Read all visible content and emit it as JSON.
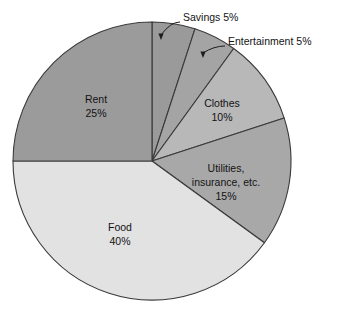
{
  "chart_data": {
    "type": "pie",
    "title": "",
    "subtitle": "",
    "xlabel": "",
    "ylabel": "",
    "legend_position": "none",
    "grid": false,
    "units": "percent",
    "total": 100,
    "start_angle_deg": 0,
    "direction": "clockwise",
    "categories": [
      "Savings",
      "Entertainment",
      "Clothes",
      "Utilities, insurance, etc.",
      "Food",
      "Rent"
    ],
    "values": [
      5,
      5,
      10,
      15,
      40,
      25
    ],
    "slices": [
      {
        "name": "Savings",
        "value": 5,
        "value_label": "5%",
        "label_mode": "callout",
        "label_line1": "Savings 5%",
        "label_line2": "",
        "color": "#9a9a9a",
        "start_deg": 0,
        "end_deg": 18
      },
      {
        "name": "Entertainment",
        "value": 5,
        "value_label": "5%",
        "label_mode": "callout",
        "label_line1": "Entertainment 5%",
        "label_line2": "",
        "color": "#a4a4a4",
        "start_deg": 18,
        "end_deg": 36
      },
      {
        "name": "Clothes",
        "value": 10,
        "value_label": "10%",
        "label_mode": "inside",
        "label_line1": "Clothes",
        "label_line2": "10%",
        "color": "#b8b8b8",
        "start_deg": 36,
        "end_deg": 72
      },
      {
        "name": "Utilities, insurance, etc.",
        "value": 15,
        "value_label": "15%",
        "label_mode": "inside",
        "label_line1": "Utilities,",
        "label_line2": "insurance, etc.",
        "label_line3": "15%",
        "color": "#a8a8a8",
        "start_deg": 72,
        "end_deg": 126
      },
      {
        "name": "Food",
        "value": 40,
        "value_label": "40%",
        "label_mode": "inside",
        "label_line1": "Food",
        "label_line2": "40%",
        "color": "#e2e2e2",
        "start_deg": 126,
        "end_deg": 270
      },
      {
        "name": "Rent",
        "value": 25,
        "value_label": "25%",
        "label_mode": "inside",
        "label_line1": "Rent",
        "label_line2": "25%",
        "color": "#9b9b9b",
        "start_deg": 270,
        "end_deg": 360
      }
    ],
    "geometry": {
      "center_x": 152,
      "center_y": 161,
      "radius": 139
    },
    "callouts": [
      {
        "name": "Savings",
        "text": "Savings 5%",
        "text_x": 183,
        "text_y": 18,
        "leader_from_x": 180,
        "leader_from_y": 22,
        "leader_to_x": 161,
        "leader_to_y": 40
      },
      {
        "name": "Entertainment",
        "text": "Entertainment 5%",
        "text_x": 228,
        "text_y": 42,
        "leader_from_x": 225,
        "leader_from_y": 46,
        "leader_to_x": 203,
        "leader_to_y": 58
      }
    ],
    "colors": {
      "background": "#ffffff",
      "outline": "#3a3a3a",
      "text": "#131313",
      "leader": "#1d1d1d"
    }
  }
}
